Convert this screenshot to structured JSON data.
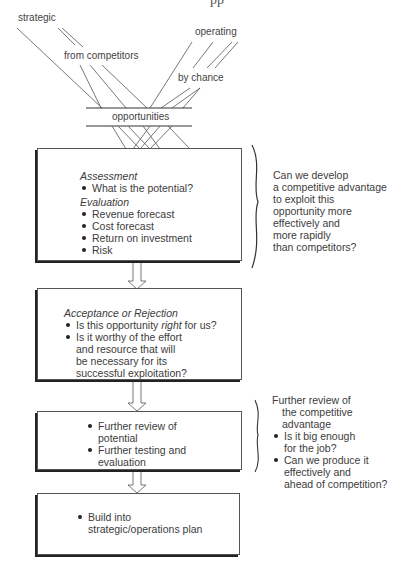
{
  "title_fragment": "pp",
  "sources": {
    "strategic": "strategic",
    "from_competitors": "from competitors",
    "operating": "operating",
    "by_chance": "by chance"
  },
  "funnel_label": "opportunities",
  "stages": [
    {
      "sections": [
        {
          "heading": "Assessment",
          "items": [
            "What is the potential?"
          ]
        },
        {
          "heading": "Evaluation",
          "items": [
            "Revenue forecast",
            "Cost forecast",
            "Return on investment",
            "Risk"
          ]
        }
      ],
      "side_note": {
        "lines": [
          "Can we develop",
          "a competitive advantage",
          "to exploit this",
          "opportunity more",
          "effectively and",
          "more rapidly",
          "than competitors?"
        ]
      }
    },
    {
      "sections": [
        {
          "heading": "Acceptance or Rejection",
          "items": [
            {
              "before": "Is this opportunity ",
              "emph": "right",
              "after": " for us?"
            },
            {
              "lines": [
                "Is it worthy of the effort",
                "and resource that will",
                "be necessary for its",
                "successful exploitation?"
              ]
            }
          ]
        }
      ]
    },
    {
      "items": [
        {
          "lines": [
            "Further review of",
            "potential"
          ]
        },
        {
          "lines": [
            "Further testing and",
            "evaluation"
          ]
        }
      ],
      "side_note": {
        "intro": [
          "Further review of",
          "the competitive",
          "advantage"
        ],
        "items": [
          {
            "lines": [
              "Is it big enough",
              "for the job?"
            ]
          },
          {
            "lines": [
              "Can we produce it",
              "effectively and",
              "ahead of competition?"
            ]
          }
        ]
      }
    },
    {
      "items": [
        {
          "lines": [
            "Build into",
            "strategic/operations plan"
          ]
        }
      ]
    }
  ]
}
